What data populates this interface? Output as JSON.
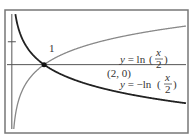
{
  "chart_data": {
    "type": "line",
    "title": "",
    "xlabel": "",
    "ylabel": "",
    "xlim": [
      -0.3,
      10.8
    ],
    "ylim": [
      -2.9,
      2.3
    ],
    "grid": false,
    "y_ticks": [
      {
        "value": 1,
        "label": "1"
      }
    ],
    "series": [
      {
        "name": "y = ln(x/2)",
        "function": "ln(x/2)",
        "color": "#888888"
      },
      {
        "name": "y = -ln(x/2)",
        "function": "-ln(x/2)",
        "color": "#222222"
      }
    ],
    "annotations": [
      {
        "text": "(2, 0)",
        "x": 2,
        "y": 0,
        "marker": true
      },
      {
        "label_prefix": "y = ln",
        "fraction_num": "x",
        "fraction_den": "2",
        "series": "y = ln(x/2)"
      },
      {
        "label_prefix": "y = −ln",
        "fraction_num": "x",
        "fraction_den": "2",
        "series": "y = -ln(x/2)"
      }
    ]
  }
}
